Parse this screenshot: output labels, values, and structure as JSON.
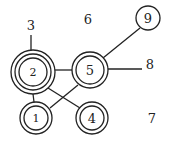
{
  "diagram": {
    "nodes": [
      {
        "id": "1",
        "label": "1",
        "rings": 2
      },
      {
        "id": "2",
        "label": "2",
        "rings": 3
      },
      {
        "id": "4",
        "label": "4",
        "rings": 2
      },
      {
        "id": "5",
        "label": "5",
        "rings": 2
      },
      {
        "id": "9",
        "label": "9",
        "rings": 1
      }
    ],
    "free_labels": {
      "l3": "3",
      "l6": "6",
      "l7": "7",
      "l8": "8"
    },
    "edges": [
      [
        "2",
        "3"
      ],
      [
        "2",
        "5"
      ],
      [
        "2",
        "1"
      ],
      [
        "2",
        "4"
      ],
      [
        "5",
        "1"
      ],
      [
        "5",
        "9"
      ],
      [
        "5",
        "8"
      ]
    ],
    "stroke_color": "#222222"
  }
}
